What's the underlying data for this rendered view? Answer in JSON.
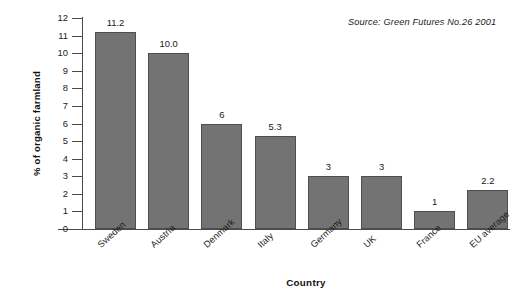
{
  "chart_data": {
    "type": "bar",
    "title": "",
    "subtitle": "",
    "xlabel": "Country",
    "ylabel": "% of organic farmland",
    "categories": [
      "Sweden",
      "Austria",
      "Denmark",
      "Italy",
      "Germany",
      "UK",
      "France",
      "EU average"
    ],
    "values": [
      11.2,
      10.0,
      6,
      5.3,
      3,
      3,
      1,
      2.2
    ],
    "value_labels": [
      "11.2",
      "10.0",
      "6",
      "5.3",
      "3",
      "3",
      "1",
      "2.2"
    ],
    "ylim": [
      0,
      12
    ],
    "ytick_labels": [
      "0",
      "1",
      "2",
      "3",
      "4",
      "5",
      "6",
      "7",
      "8",
      "9",
      "10",
      "11",
      "12"
    ],
    "ytick_values": [
      0,
      1,
      2,
      3,
      4,
      5,
      6,
      7,
      8,
      9,
      10,
      11,
      12
    ],
    "grid": false,
    "legend": false,
    "legend_position": "none",
    "annotations": [
      "Source: Green Futures No.26 2001"
    ],
    "bar_color": "#737373",
    "bar_border_color": "#4f4f4f",
    "axis_color": "#4a4a4a",
    "background_color": "#ffffff"
  },
  "source": {
    "note": "Source: Green Futures No.26 2001"
  }
}
